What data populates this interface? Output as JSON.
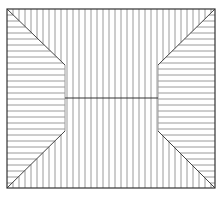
{
  "diagram": {
    "type": "hatched-panel-pattern",
    "frame": {
      "x1": 7,
      "y1": 9,
      "x2": 215,
      "y2": 188
    },
    "inner": {
      "x1": 65,
      "x2": 158,
      "y_top": 65,
      "y_bottom": 131,
      "y_mid": 98
    },
    "spacing": 6,
    "colors": {
      "line": "#9a9a9a",
      "frame": "#333333",
      "diagonal": "#444444",
      "background": "#ffffff"
    }
  }
}
